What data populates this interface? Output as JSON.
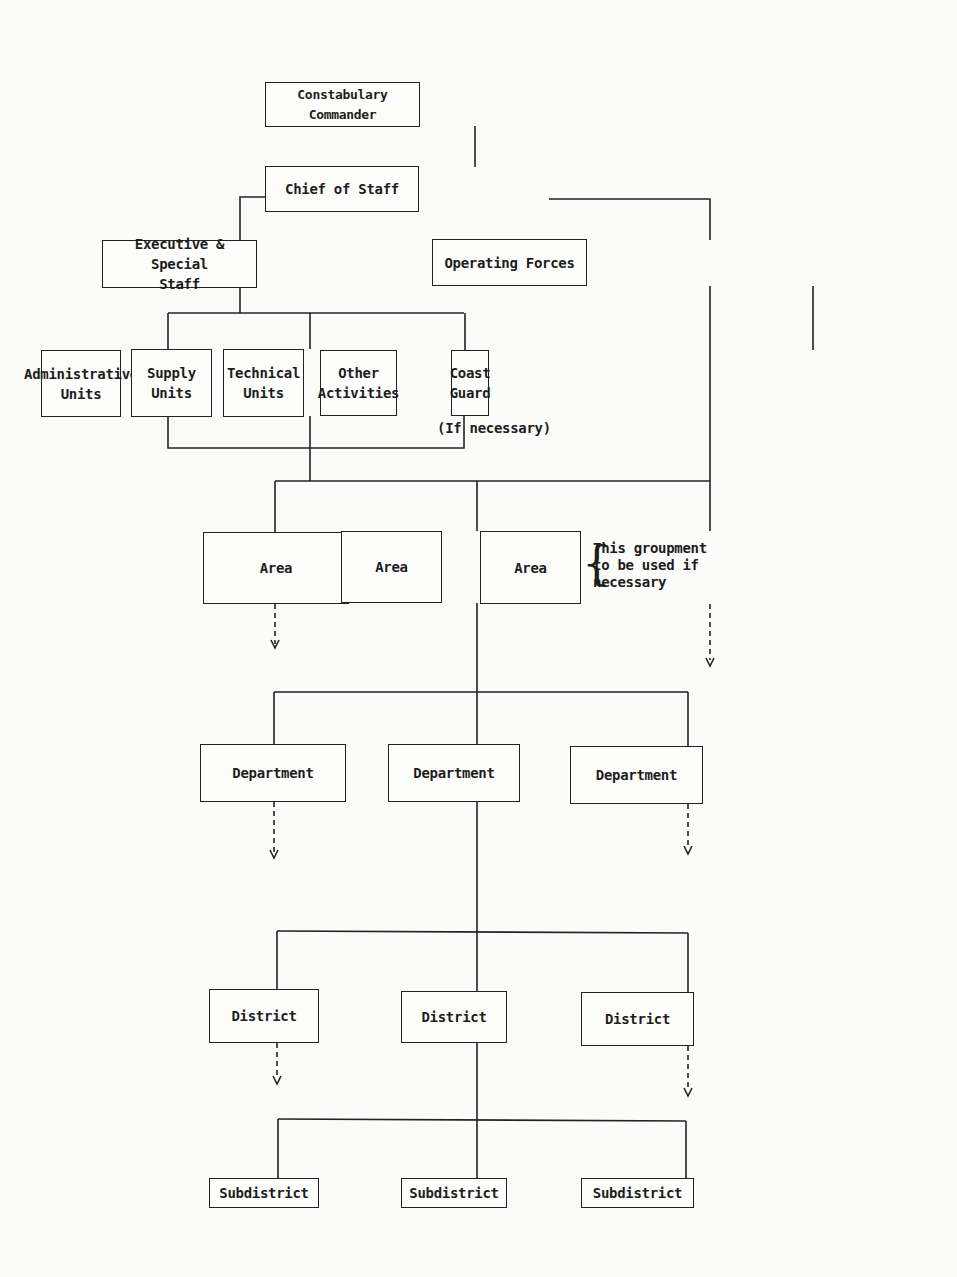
{
  "diagram": {
    "type": "organization-chart",
    "nodes": {
      "commander": "Constabulary Commander",
      "chief_of_staff": "Chief of Staff",
      "executive_staff": "Executive & Special\nStaff",
      "operating_forces": "Operating Forces",
      "administrative_units": "Administrative\nUnits",
      "supply_units": "Supply\nUnits",
      "technical_units": "Technical\nUnits",
      "other_activities": "Other\nActivities",
      "coast_guard": "Coast\nGuard",
      "area_1": "Area",
      "area_2": "Area",
      "area_3": "Area",
      "department_1": "Department",
      "department_2": "Department",
      "department_3": "Department",
      "district_1": "District",
      "district_2": "District",
      "district_3": "District",
      "subdistrict_1": "Subdistrict",
      "subdistrict_2": "Subdistrict",
      "subdistrict_3": "Subdistrict"
    },
    "notes": {
      "coast_guard_note": "(If necessary)",
      "area_groupment_note": "This groupment\nto be used if\nnecessary"
    },
    "edges": [
      [
        "Constabulary Commander",
        "Chief of Staff"
      ],
      [
        "Chief of Staff",
        "Executive & Special Staff"
      ],
      [
        "Chief of Staff",
        "Operating Forces"
      ],
      [
        "Executive & Special Staff",
        "Administrative Units"
      ],
      [
        "Executive & Special Staff",
        "Supply Units"
      ],
      [
        "Executive & Special Staff",
        "Technical Units"
      ],
      [
        "Executive & Special Staff",
        "Other Activities"
      ],
      [
        "Operating Forces",
        "Coast Guard"
      ],
      [
        "Operating Forces",
        "Area (all)"
      ],
      [
        "Supply Units",
        "Area (all)"
      ],
      [
        "Area (center)",
        "Department (all)"
      ],
      [
        "Department (center)",
        "District (all)"
      ],
      [
        "District (center)",
        "Subdistrict (all)"
      ]
    ],
    "dashed_continuations": [
      "Area (left)",
      "Area (right)",
      "Department (left)",
      "Department (right)",
      "District (left)",
      "District (right)"
    ]
  }
}
